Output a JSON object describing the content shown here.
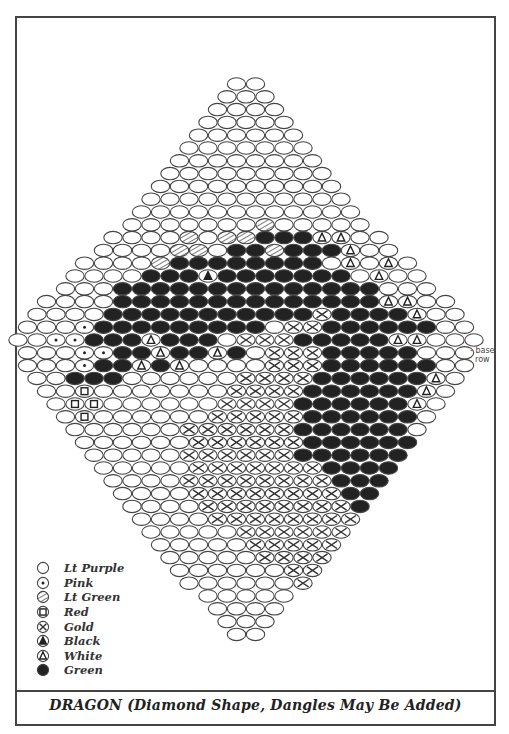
{
  "title": "DRAGON  (Diamond Shape, Dangles May Be Added)",
  "annotation": {
    "marker": "-",
    "line1": "base",
    "line2": "row"
  },
  "legend": [
    {
      "code": "W",
      "label": "Lt Purple",
      "symbol": "open-circle"
    },
    {
      "code": "P",
      "label": "Pink",
      "symbol": "dot-circle"
    },
    {
      "code": "L",
      "label": "Lt Green",
      "symbol": "hatched-circle"
    },
    {
      "code": "R",
      "label": "Red",
      "symbol": "square-circle"
    },
    {
      "code": "G",
      "label": "Gold",
      "symbol": "x-circle"
    },
    {
      "code": "K",
      "label": "Black",
      "symbol": "filled-triangle-circle"
    },
    {
      "code": "T",
      "label": "White",
      "symbol": "open-triangle-circle"
    },
    {
      "code": "N",
      "label": "Green",
      "symbol": "filled-circle"
    }
  ],
  "pattern": {
    "base_row_index": 21,
    "rows": [
      "WW",
      "WWW",
      "WWWW",
      "WWWWW",
      "WWWWWW",
      "WWWWWWW",
      "WWWWWWWW",
      "WWWWWWWWW",
      "WWWWWWWWWW",
      "WWWWWWWWWWW",
      "WWWWWWWWWWWW",
      "WWWWWWWLWWWWW",
      "WWWWLWLLNNNTTWW",
      "WWWWLLWNNLNNNTWW",
      "WWWWLNNNNNNNNWTWTW",
      "WWWWNNNKNNNNNNNWTWW",
      "WWWNNNNNNNNNNNNNNWWW",
      "WWWWNNNNNNNNNNNNNNTTWW",
      "WWWWNNNNNNNNNNNGNNNNTWW",
      "WWWPNNNNNNNNNWGGNNNNNNWW",
      "WWPPNNNTNNNWGGGNNNNNTTWWW",
      "WWWPPNNTNNTNWGGGNNNNNWWW",
      "WWWPNNTNTWWWWGGGNNNNNNWW",
      "WWNNNWWWWWWGGGGNNNNNNTW",
      "WWRWWWWWWWGGGGNNNNNNTW",
      "WRRWWWWWWGGGGNNNNNNTW",
      "WRWWWWWWGGGGGNNNNNNW",
      "WWWWWWGGGGGGNNNNNNW",
      "WWWWWWGGGGGGNNNNNN",
      "WWWWWGGGGGGNNNNNN",
      "WWWWWGGGGGGGNNNN",
      "WWWWGGGGGGGGNNN",
      "WWWWGGGGGGGGNN",
      "WWWWGGGGGGGGN",
      "WWWWGGGGGGGG",
      "WWWWWGGGGGG",
      "WWWWWGGGGG",
      "WWWWWGGGG",
      "WWWWWWGG",
      "WWWWWWG",
      "WWWWW",
      "WWWW",
      "WWW",
      "WW"
    ]
  }
}
